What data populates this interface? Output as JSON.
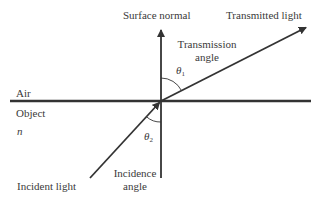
{
  "diagram": {
    "labels": {
      "surface_normal": "Surface normal",
      "transmitted_light": "Transmitted light",
      "transmission_angle_line1": "Transmission",
      "transmission_angle_line2": "angle",
      "air": "Air",
      "object": "Object",
      "refractive_index": "n",
      "incident_light": "Incident light",
      "incidence_angle_line1": "Incidence",
      "incidence_angle_line2": "angle"
    },
    "angles": {
      "theta1_symbol": "θ",
      "theta1_subscript": "1",
      "theta2_symbol": "θ",
      "theta2_subscript": "2"
    },
    "colors": {
      "line": "#333333",
      "text": "#3a3a3a",
      "background": "#ffffff"
    },
    "geometry": {
      "interface_y": 101,
      "interface_x_range": [
        10,
        311
      ],
      "normal_x": 161,
      "normal_y_range": [
        28,
        178
      ],
      "incident_ray": {
        "from": [
          90,
          178
        ],
        "to": [
          161,
          101
        ]
      },
      "transmitted_ray": {
        "from": [
          161,
          101
        ],
        "to": [
          307,
          27
        ]
      }
    }
  }
}
